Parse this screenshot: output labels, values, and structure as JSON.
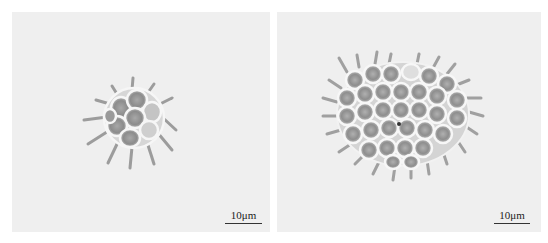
{
  "figure": {
    "panels": [
      {
        "id": "left",
        "subject": "small spiny colonial green alga (Pediastrum-like coenobium), ~10 cells",
        "scale_bar": {
          "label": "10μm"
        }
      },
      {
        "id": "right",
        "subject": "large spiny colonial green alga (Pediastrum-like coenobium), ~32 cells",
        "scale_bar": {
          "label": "10μm"
        }
      }
    ],
    "colors": {
      "background": "#efefef",
      "cell_wall": "#f8f8f8",
      "cell_content": "#8a8a8a",
      "spine": "#9a9a9a",
      "scale_bar": "#333333"
    }
  }
}
